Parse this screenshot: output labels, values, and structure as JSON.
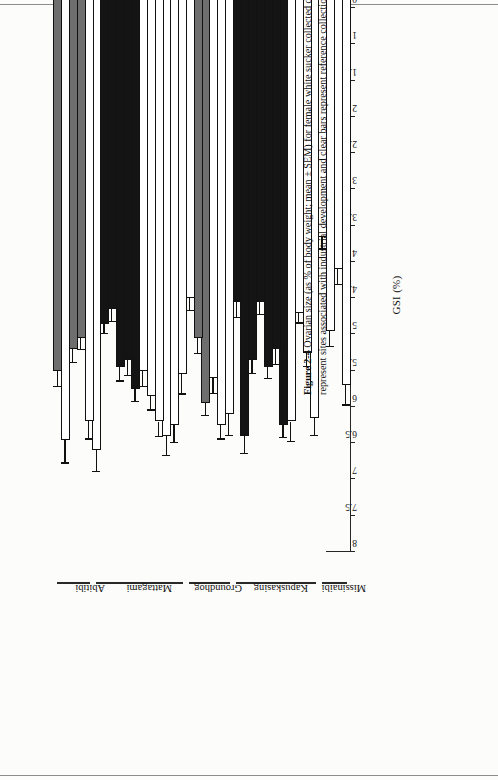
{
  "figure": {
    "label": "Figure 2-4",
    "caption": "Ovarian size (as % of body weight; mean ± SEM) for female white sucker collected during the fall at sites in the Moose River basin. Shaded and dark bars represent sites associated with industrial development and clear bars represent reference collections."
  },
  "chart_data": {
    "type": "bar",
    "orientation": "horizontal",
    "title": "",
    "xlabel": "GSI (%)",
    "ylabel": "",
    "xlim": [
      0,
      8
    ],
    "xticks": [
      "0",
      "0.5",
      "1",
      "1.5",
      "2",
      "2.5",
      "3",
      "3.5",
      "4",
      "4.5",
      "5",
      "5.5",
      "6",
      "6.5",
      "7",
      "7.5",
      "8"
    ],
    "grid": false,
    "legend": {
      "position": "none",
      "entries": [
        {
          "name": "clear",
          "label": "reference collections",
          "color": "#ffffff"
        },
        {
          "name": "shaded",
          "label": "industrial development (shaded)",
          "color": "#6e6e6e"
        },
        {
          "name": "dark",
          "label": "industrial development (dark)",
          "color": "#141414"
        }
      ]
    },
    "groups": [
      {
        "name": "Missinaibi",
        "start": 0,
        "count": 4
      },
      {
        "name": "Kapuskasing",
        "start": 4,
        "count": 11
      },
      {
        "name": "Groundhog",
        "start": 15,
        "count": 6
      },
      {
        "name": "Mattagami",
        "start": 21,
        "count": 12
      },
      {
        "name": "Abitibi",
        "start": 33,
        "count": 5
      }
    ],
    "categories": [
      "REF(94)",
      "",
      "SR(96)",
      "",
      "",
      "WP(95)",
      "",
      "UP(94)",
      "",
      "IR(95)",
      "",
      "FF(91)",
      "",
      "FF(94)",
      "FF(96)",
      "CJ(96)",
      "",
      "FR(91)",
      "",
      "FR(94)",
      "FR(97)",
      "",
      "UP(94)",
      "",
      "UP(96)",
      "",
      "UP(98)",
      "",
      "SRF(93)",
      "",
      "SRF(95)",
      "SRF(97)",
      "CYP(96)",
      "",
      "HR(97)",
      "",
      "FHL8(98)",
      "UP(98)"
    ],
    "values": [
      5.7,
      4.1,
      4.95,
      3.65,
      6.15,
      5.25,
      4.7,
      6.2,
      6.25,
      5.2,
      5.45,
      4.55,
      5.35,
      6.4,
      4.55,
      6.1,
      6.25,
      5.6,
      5.95,
      5.05,
      4.5,
      5.55,
      6.25,
      6.4,
      6.2,
      5.85,
      5.5,
      5.75,
      5.35,
      5.45,
      4.65,
      4.85,
      6.6,
      6.2,
      5.05,
      5.2,
      6.45,
      5.5
    ],
    "errors": [
      0.28,
      0.22,
      0.22,
      0.18,
      0.25,
      0.2,
      0.15,
      0.28,
      0.18,
      0.22,
      0.16,
      0.18,
      0.2,
      0.25,
      0.22,
      0.3,
      0.2,
      0.22,
      0.18,
      0.22,
      0.18,
      0.28,
      0.25,
      0.28,
      0.22,
      0.2,
      0.22,
      0.18,
      0.22,
      0.2,
      0.18,
      0.15,
      0.3,
      0.25,
      0.16,
      0.2,
      0.33,
      0.22
    ],
    "fills": [
      "clear",
      "clear",
      "clear",
      "clear",
      "clear",
      "clear",
      "clear",
      "clear",
      "dark",
      "dark",
      "dark",
      "dark",
      "dark",
      "dark",
      "dark",
      "clear",
      "clear",
      "clear",
      "shaded",
      "shaded",
      "clear",
      "clear",
      "clear",
      "clear",
      "clear",
      "clear",
      "clear",
      "dark",
      "dark",
      "dark",
      "dark",
      "dark",
      "clear",
      "clear",
      "shaded",
      "shaded",
      "clear",
      "shaded",
      "dark"
    ]
  }
}
